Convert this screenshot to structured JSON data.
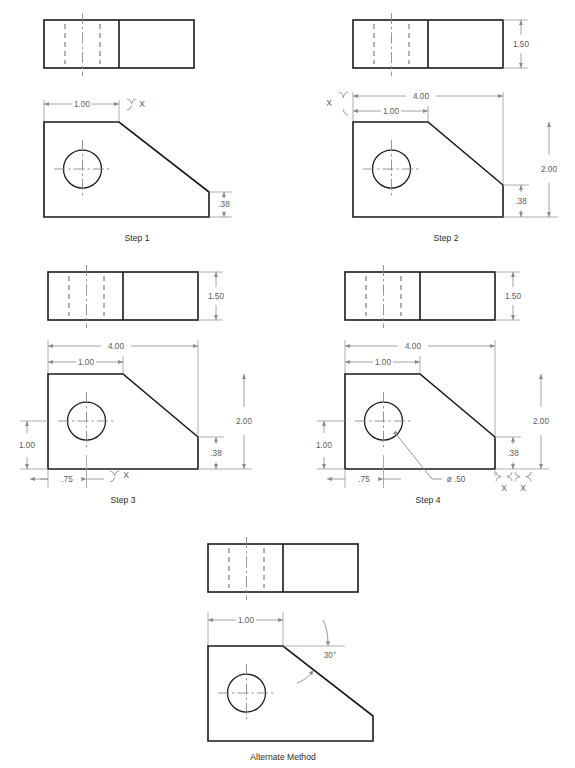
{
  "document": {
    "title": "Mechanical Part Construction Steps",
    "background_color": "#ffffff",
    "line_color": "#1a1a1a",
    "dimension_color": "#8a8a8a",
    "hidden_line_color": "#6f6f6f"
  },
  "figures": [
    {
      "id": "step1",
      "caption": "Step 1",
      "views": [
        "top",
        "front"
      ],
      "dimensions": [
        {
          "label": "1.00",
          "orientation": "horizontal",
          "position": "above-front-view"
        },
        {
          "label": ".38",
          "orientation": "vertical",
          "position": "right-front-view"
        }
      ],
      "annotations": [
        {
          "label": "X",
          "type": "brace",
          "position": "top-right-of-1.00"
        }
      ]
    },
    {
      "id": "step2",
      "caption": "Step 2",
      "views": [
        "top",
        "front"
      ],
      "dimensions": [
        {
          "label": "1.50",
          "orientation": "vertical",
          "position": "right-top-view"
        },
        {
          "label": "4.00",
          "orientation": "horizontal",
          "position": "above-front-view"
        },
        {
          "label": "1.00",
          "orientation": "horizontal",
          "position": "above-front-view"
        },
        {
          "label": "2.00",
          "orientation": "vertical",
          "position": "right-front-view"
        },
        {
          "label": ".38",
          "orientation": "vertical",
          "position": "right-front-view"
        }
      ],
      "annotations": [
        {
          "label": "X",
          "type": "brace",
          "position": "left-of-dimension-stack"
        }
      ]
    },
    {
      "id": "step3",
      "caption": "Step 3",
      "views": [
        "top",
        "front"
      ],
      "dimensions": [
        {
          "label": "1.50",
          "orientation": "vertical",
          "position": "right-top-view"
        },
        {
          "label": "4.00",
          "orientation": "horizontal",
          "position": "above-front-view"
        },
        {
          "label": "1.00",
          "orientation": "horizontal",
          "position": "above-front-view"
        },
        {
          "label": "2.00",
          "orientation": "vertical",
          "position": "right-front-view"
        },
        {
          "label": ".38",
          "orientation": "vertical",
          "position": "right-front-view"
        },
        {
          "label": "1.00",
          "orientation": "vertical",
          "position": "left-front-view"
        },
        {
          "label": ".75",
          "orientation": "horizontal",
          "position": "below-front-view"
        }
      ],
      "annotations": [
        {
          "label": "X",
          "type": "brace",
          "position": "below-front-view-right-of-.75"
        }
      ]
    },
    {
      "id": "step4",
      "caption": "Step 4",
      "views": [
        "top",
        "front"
      ],
      "dimensions": [
        {
          "label": "1.50",
          "orientation": "vertical",
          "position": "right-top-view"
        },
        {
          "label": "4.00",
          "orientation": "horizontal",
          "position": "above-front-view"
        },
        {
          "label": "1.00",
          "orientation": "horizontal",
          "position": "above-front-view"
        },
        {
          "label": "2.00",
          "orientation": "vertical",
          "position": "right-front-view"
        },
        {
          "label": ".38",
          "orientation": "vertical",
          "position": "right-front-view"
        },
        {
          "label": "1.00",
          "orientation": "vertical",
          "position": "left-front-view"
        },
        {
          "label": ".75",
          "orientation": "horizontal",
          "position": "below-front-view"
        }
      ],
      "annotations": [
        {
          "label": "ø .50",
          "type": "leader",
          "position": "hole-callout"
        },
        {
          "label": "X",
          "type": "brace",
          "position": "bottom-right-first"
        },
        {
          "label": "X",
          "type": "brace",
          "position": "bottom-right-second"
        }
      ]
    },
    {
      "id": "alternate",
      "caption": "Alternate Method",
      "views": [
        "top",
        "front"
      ],
      "dimensions": [
        {
          "label": "1.00",
          "orientation": "horizontal",
          "position": "above-front-view"
        }
      ],
      "annotations": [
        {
          "label": "30°",
          "type": "angle",
          "position": "on-chamfer"
        }
      ]
    }
  ],
  "labels": {
    "step1": "Step 1",
    "step2": "Step 2",
    "step3": "Step 3",
    "step4": "Step 4",
    "alternate": "Alternate Method",
    "d_1_00": "1.00",
    "d_1_50": "1.50",
    "d_2_00": "2.00",
    "d_4_00": "4.00",
    "d_0_38": ".38",
    "d_0_75": ".75",
    "d_dia_50": "ø .50",
    "d_30deg": "30°",
    "x": "X"
  }
}
